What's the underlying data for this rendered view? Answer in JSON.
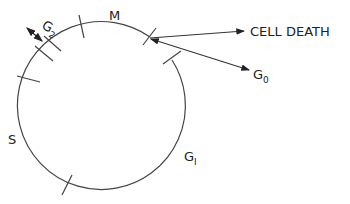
{
  "diagram": {
    "phases": [
      {
        "id": "M",
        "label": "M"
      },
      {
        "id": "G2",
        "label": "G",
        "sub": "2"
      },
      {
        "id": "S",
        "label": "S"
      },
      {
        "id": "G1",
        "label": "G",
        "sub": "I"
      }
    ],
    "exits": [
      {
        "id": "cell-death",
        "label": "CELL DEATH"
      },
      {
        "id": "G0",
        "label": "G",
        "sub": "0"
      }
    ],
    "colors": {
      "stroke": "#333333",
      "background": "#ffffff"
    }
  }
}
